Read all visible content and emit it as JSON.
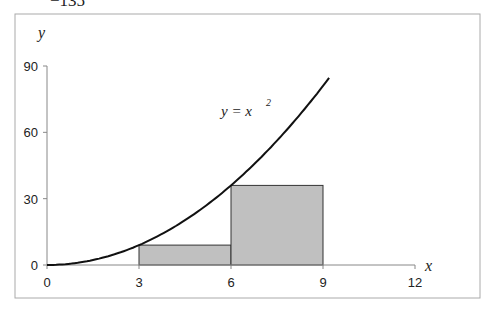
{
  "top_fragment": "−135",
  "chart_data": {
    "type": "line",
    "title": "",
    "xlabel": "x",
    "ylabel": "y",
    "curve_label": "y = x",
    "curve_label_exp": "2",
    "xlim": [
      0,
      12
    ],
    "ylim": [
      0,
      90
    ],
    "xticks": [
      "0",
      "3",
      "6",
      "9",
      "12"
    ],
    "yticks": [
      "0",
      "30",
      "60",
      "90"
    ],
    "grid": false,
    "series": [
      {
        "name": "y = x^2",
        "x": [
          0,
          1,
          2,
          3,
          4,
          5,
          6,
          7,
          8,
          9,
          9.2
        ],
        "values": [
          0,
          1,
          4,
          9,
          16,
          25,
          36,
          49,
          64,
          81,
          84.6
        ]
      }
    ],
    "rectangles": [
      {
        "x0": 3,
        "x1": 6,
        "height": 9
      },
      {
        "x0": 6,
        "x1": 9,
        "height": 36
      }
    ],
    "colors": {
      "curve": "#111111",
      "rect_fill": "#c0c0c0",
      "rect_stroke": "#333333",
      "axis": "#888888"
    }
  }
}
